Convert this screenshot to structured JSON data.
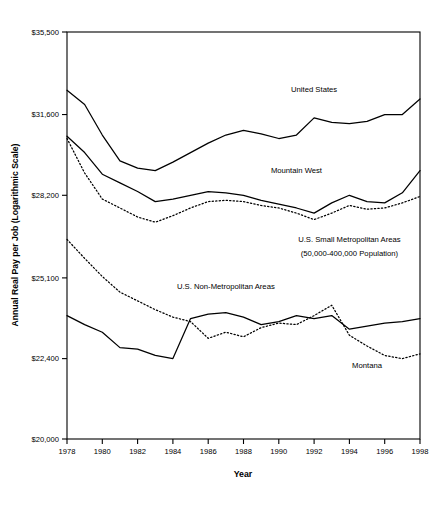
{
  "chart_data": {
    "type": "line",
    "title": "",
    "xlabel": "Year",
    "ylabel": "Annual Real Pay per Job (Logarithmic Scale)",
    "scale": "log",
    "grid": false,
    "legend_position": "inline-annotations",
    "xlim": [
      1978,
      1998
    ],
    "ylim": [
      20000,
      35500
    ],
    "xticks": [
      1978,
      1980,
      1982,
      1984,
      1986,
      1988,
      1990,
      1992,
      1994,
      1996,
      1998
    ],
    "xticklabels": [
      "1978",
      "1980",
      "1982",
      "1984",
      "1986",
      "1988",
      "1990",
      "1992",
      "1994",
      "1996",
      "1998"
    ],
    "yticks": [
      20000,
      22400,
      25100,
      28200,
      31600,
      35500
    ],
    "yticklabels": [
      "$20,000",
      "$22,400",
      "$25,100",
      "$28,200",
      "$31,600",
      "$35,500"
    ],
    "x": [
      1978,
      1979,
      1980,
      1981,
      1982,
      1983,
      1984,
      1985,
      1986,
      1987,
      1988,
      1989,
      1990,
      1991,
      1992,
      1993,
      1994,
      1995,
      1996,
      1997,
      1998
    ],
    "series": [
      {
        "name": "United States",
        "style": "solid",
        "label": "United States",
        "values": [
          32700,
          32050,
          30700,
          29600,
          29300,
          29200,
          29550,
          29950,
          30350,
          30700,
          30900,
          30750,
          30550,
          30700,
          31450,
          31250,
          31200,
          31300,
          31600,
          31600,
          32300
        ]
      },
      {
        "name": "Mountain West",
        "style": "solid",
        "label": "Mountain West",
        "values": [
          30650,
          29950,
          29050,
          28700,
          28350,
          27950,
          28050,
          28200,
          28350,
          28300,
          28200,
          28000,
          27850,
          27700,
          27500,
          27900,
          28200,
          27950,
          27900,
          28300,
          29200
        ]
      },
      {
        "name": "U.S. Small Metropolitan Areas",
        "style": "dotted",
        "label": "U.S. Small Metropolitan Areas",
        "label_line2": "(50,000-400,000 Population)",
        "values": [
          30550,
          29100,
          28050,
          27700,
          27350,
          27150,
          27400,
          27700,
          27950,
          28000,
          27950,
          27800,
          27700,
          27500,
          27250,
          27500,
          27800,
          27650,
          27700,
          27900,
          28150
        ]
      },
      {
        "name": "U.S. Non-Metropolitan Areas",
        "style": "solid",
        "label": "U.S. Non-Metropolitan Areas",
        "values": [
          23800,
          23500,
          23250,
          22750,
          22700,
          22500,
          22400,
          23700,
          23850,
          23900,
          23750,
          23500,
          23600,
          23800,
          23700,
          23800,
          23350,
          23450,
          23550,
          23600,
          23700
        ]
      },
      {
        "name": "Montana",
        "style": "dotted",
        "label": "Montana",
        "values": [
          26500,
          25800,
          25150,
          24600,
          24300,
          24000,
          23750,
          23600,
          23050,
          23250,
          23100,
          23400,
          23550,
          23500,
          23800,
          24150,
          23150,
          22800,
          22500,
          22400,
          22550
        ]
      }
    ],
    "annotations": [
      {
        "text": "United States",
        "x": 1992,
        "y": 32600
      },
      {
        "text": "Mountain West",
        "x": 1991,
        "y": 29100
      },
      {
        "text": "U.S. Small Metropolitan Areas",
        "x": 1994,
        "y": 26400
      },
      {
        "text": "(50,000-400,000 Population)",
        "x": 1994,
        "y": 25900
      },
      {
        "text": "U.S. Non-Metropolitan Areas",
        "x": 1987,
        "y": 24700
      },
      {
        "text": "Montana",
        "x": 1995,
        "y": 22100
      }
    ]
  },
  "caption": {
    "text": ""
  }
}
